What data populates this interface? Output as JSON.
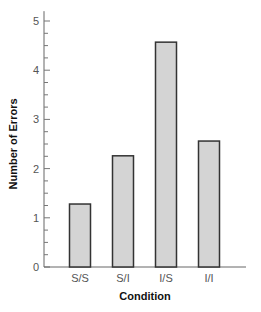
{
  "chart_data": {
    "type": "bar",
    "title": "",
    "xlabel": "Condition",
    "ylabel": "Number of Errors",
    "categories": [
      "S/S",
      "S/I",
      "I/S",
      "I/I"
    ],
    "values": [
      1.28,
      2.26,
      4.57,
      2.56
    ],
    "ylim": [
      0,
      5.2
    ],
    "yticks": [
      0,
      1,
      2,
      3,
      4,
      5
    ],
    "minor_ticks_per_unit": 4,
    "grid": false,
    "legend": null,
    "bar_fill": "#d4d4d4",
    "bar_stroke": "#333333"
  }
}
